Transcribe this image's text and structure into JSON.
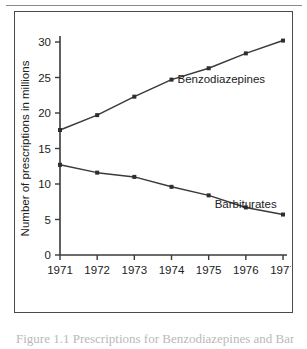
{
  "figure": {
    "caption_cutoff_text": "Figure 1.1 Prescriptions for Benzodiazepines and Barbiturates"
  },
  "chart_data": {
    "type": "line",
    "title": "",
    "xlabel": "",
    "ylabel": "Number of prescriptions in millions",
    "x": [
      "1971",
      "1972",
      "1973",
      "1974",
      "1975",
      "1976",
      "1977"
    ],
    "xtick_labels": [
      "1971",
      "1972",
      "1973",
      "1974",
      "1975",
      "1976",
      "1977"
    ],
    "ytick_labels": [
      "0",
      "5",
      "10",
      "15",
      "20",
      "25",
      "30"
    ],
    "ytick_values": [
      0,
      5,
      10,
      15,
      20,
      25,
      30
    ],
    "ylim": [
      0,
      30
    ],
    "grid": false,
    "legend_position": "inline-annotation",
    "series": [
      {
        "name": "Benzodiazepines",
        "label": "Benzodiazepines",
        "values": [
          17.6,
          19.7,
          22.3,
          24.7,
          26.3,
          28.4,
          30.2
        ],
        "color": "#3a3a3a"
      },
      {
        "name": "Barbiturates",
        "label": "Barbiturates",
        "values": [
          12.7,
          11.6,
          11.0,
          9.6,
          8.4,
          6.7,
          5.7
        ],
        "color": "#3a3a3a"
      }
    ],
    "annotations": [
      {
        "text": "Benzodiazepines",
        "x": "1974",
        "y": 24.2
      },
      {
        "text": "Barbiturates",
        "x": "1975",
        "y": 6.6
      }
    ]
  }
}
